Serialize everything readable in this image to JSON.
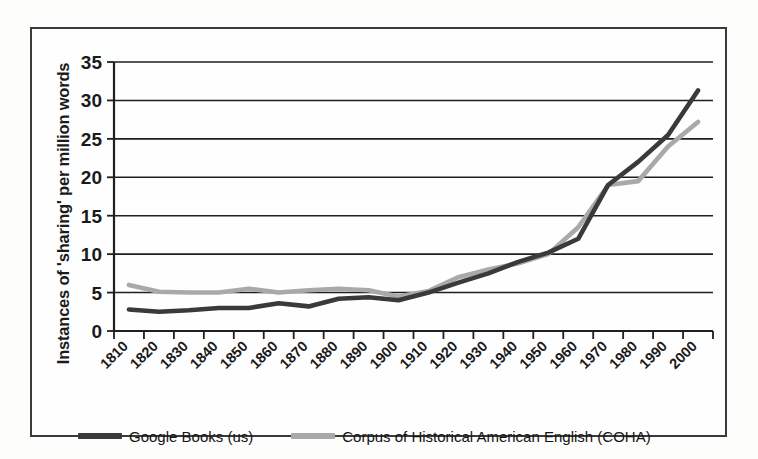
{
  "figure": {
    "y_axis_title": "Instances of 'sharing' per million words"
  },
  "legend": {
    "entries": [
      {
        "label": "Google Books (us)",
        "color": "#3a3a3a",
        "icon": "line-swatch-icon"
      },
      {
        "label": "Corpus of Historical American English (COHA)",
        "color": "#a9a9a9",
        "icon": "line-swatch-icon"
      }
    ]
  },
  "chart_data": {
    "type": "line",
    "title": "",
    "xlabel": "",
    "ylabel": "Instances of 'sharing' per million words",
    "categories": [
      "1810",
      "1820",
      "1830",
      "1840",
      "1850",
      "1860",
      "1870",
      "1880",
      "1890",
      "1900",
      "1910",
      "1920",
      "1930",
      "1940",
      "1950",
      "1960",
      "1970",
      "1980",
      "1990",
      "2000"
    ],
    "ytick_labels": [
      "0",
      "5",
      "10",
      "15",
      "20",
      "25",
      "30",
      "35"
    ],
    "yticks": [
      0,
      5,
      10,
      15,
      20,
      25,
      30,
      35
    ],
    "ylim": [
      0,
      35
    ],
    "grid": true,
    "legend_position": "bottom",
    "series": [
      {
        "name": "Google Books (us)",
        "color": "#3a3a3a",
        "values": [
          2.8,
          2.5,
          2.7,
          3.0,
          3.0,
          3.6,
          3.2,
          4.2,
          4.4,
          4.0,
          5.0,
          6.3,
          7.5,
          9.0,
          10.2,
          12.0,
          19.0,
          22.0,
          25.5,
          31.3
        ]
      },
      {
        "name": "Corpus of Historical American English (COHA)",
        "color": "#a9a9a9",
        "values": [
          6.0,
          5.1,
          5.0,
          5.0,
          5.5,
          5.0,
          5.3,
          5.5,
          5.3,
          4.5,
          5.2,
          7.0,
          8.0,
          8.8,
          10.0,
          13.5,
          19.0,
          19.5,
          24.0,
          27.2
        ]
      }
    ]
  }
}
